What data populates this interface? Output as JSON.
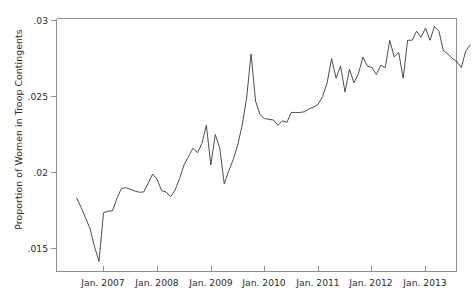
{
  "chart_data": {
    "type": "line",
    "title": "",
    "xlabel": "",
    "ylabel": "Proportion of Women in Troop Contingents",
    "ylim": [
      0.0135,
      0.0305
    ],
    "xlim": [
      "2006-07",
      "2013-11"
    ],
    "grid": false,
    "legend": null,
    "y_ticks": [
      0.015,
      0.02,
      0.025,
      0.03
    ],
    "y_tick_labels": [
      ".015",
      ".02",
      ".025",
      ".03"
    ],
    "x_ticks": [
      "2007-01",
      "2008-01",
      "2009-01",
      "2010-01",
      "2011-01",
      "2012-01",
      "2013-01"
    ],
    "x_tick_labels": [
      "Jan. 2007",
      "Jan. 2008",
      "Jan. 2009",
      "Jan. 2010",
      "Jan. 2011",
      "Jan. 2012",
      "Jan. 2013"
    ],
    "line_color": "#3a3a3a",
    "line_width": 0.9,
    "series": [
      {
        "name": "Proportion of Women in Troop Contingents",
        "x": [
          "2006-07",
          "2006-08",
          "2006-09",
          "2006-10",
          "2006-11",
          "2006-12",
          "2007-01",
          "2007-02",
          "2007-03",
          "2007-04",
          "2007-05",
          "2007-06",
          "2007-07",
          "2007-08",
          "2007-09",
          "2007-10",
          "2007-11",
          "2007-12",
          "2008-01",
          "2008-02",
          "2008-03",
          "2008-04",
          "2008-05",
          "2008-06",
          "2008-07",
          "2008-08",
          "2008-09",
          "2008-10",
          "2008-11",
          "2008-12",
          "2009-01",
          "2009-02",
          "2009-03",
          "2009-04",
          "2009-05",
          "2009-06",
          "2009-07",
          "2009-08",
          "2009-09",
          "2009-10",
          "2009-11",
          "2009-12",
          "2010-01",
          "2010-02",
          "2010-03",
          "2010-04",
          "2010-05",
          "2010-06",
          "2010-07",
          "2010-08",
          "2010-09",
          "2010-10",
          "2010-11",
          "2010-12",
          "2011-01",
          "2011-02",
          "2011-03",
          "2011-04",
          "2011-05",
          "2011-06",
          "2011-07",
          "2011-08",
          "2011-09",
          "2011-10",
          "2011-11",
          "2011-12",
          "2012-01",
          "2012-02",
          "2012-03",
          "2012-04",
          "2012-05",
          "2012-06",
          "2012-07",
          "2012-08",
          "2012-09",
          "2012-10",
          "2012-11",
          "2012-12",
          "2013-01",
          "2013-02",
          "2013-03",
          "2013-04",
          "2013-05",
          "2013-06",
          "2013-07",
          "2013-08",
          "2013-09",
          "2013-10",
          "2013-11"
        ],
        "y": [
          0.01832,
          0.0177,
          0.017,
          0.0163,
          0.0151,
          0.01415,
          0.01735,
          0.01745,
          0.01748,
          0.0183,
          0.01895,
          0.019,
          0.0189,
          0.01878,
          0.0187,
          0.01872,
          0.0193,
          0.0199,
          0.01955,
          0.0188,
          0.01872,
          0.0184,
          0.01885,
          0.0196,
          0.0205,
          0.02105,
          0.0216,
          0.0213,
          0.0219,
          0.0231,
          0.0205,
          0.0225,
          0.0216,
          0.01925,
          0.0201,
          0.02085,
          0.0218,
          0.0231,
          0.0249,
          0.0278,
          0.0247,
          0.0238,
          0.02355,
          0.0235,
          0.02345,
          0.0231,
          0.0234,
          0.0233,
          0.02395,
          0.02395,
          0.02395,
          0.024,
          0.0242,
          0.0243,
          0.0245,
          0.025,
          0.0259,
          0.0275,
          0.0262,
          0.027,
          0.0253,
          0.0268,
          0.0259,
          0.0265,
          0.0276,
          0.027,
          0.0269,
          0.02645,
          0.02705,
          0.0269,
          0.0287,
          0.0276,
          0.0279,
          0.0262,
          0.0287,
          0.0287,
          0.0293,
          0.0289,
          0.0295,
          0.0287,
          0.0296,
          0.0293,
          0.028,
          0.0278,
          0.0275,
          0.0273,
          0.0269,
          0.028,
          0.0284
        ]
      }
    ]
  },
  "axes": {
    "y_label": "Proportion of Women in Troop Contingents"
  }
}
